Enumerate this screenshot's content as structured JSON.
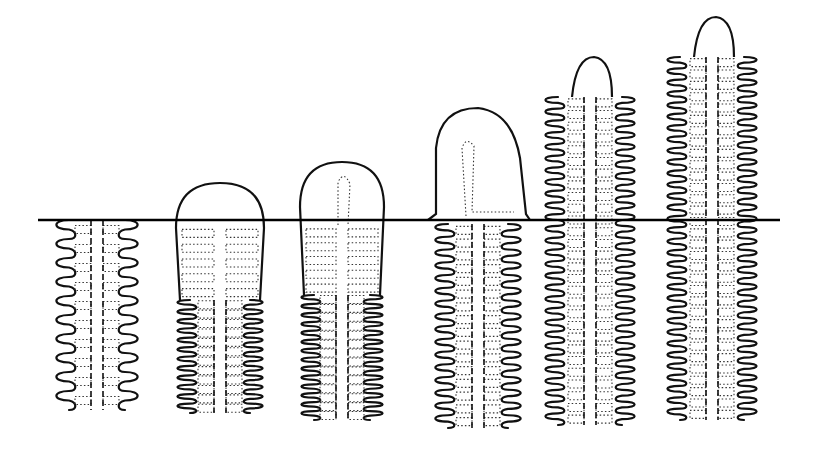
{
  "figure": {
    "surface_line": {
      "x1": 38,
      "x2": 780,
      "y": 220
    },
    "line_color": "#111111",
    "background": "#ffffff",
    "stages": [
      {
        "id": 1,
        "cx": 97,
        "top": 220,
        "bottom": 410,
        "halfWidth": 42,
        "tip": "none",
        "emerged": false,
        "rings": 14
      },
      {
        "id": 2,
        "cx": 220,
        "top": 183,
        "bottom": 413,
        "halfWidth": 44,
        "tip": "dome",
        "emerged": true,
        "rings": 16
      },
      {
        "id": 3,
        "cx": 342,
        "top": 162,
        "bottom": 420,
        "halfWidth": 42,
        "tip": "dome",
        "emerged": true,
        "rings": 18
      },
      {
        "id": 4,
        "cx": 478,
        "top": 108,
        "bottom": 428,
        "halfWidth": 44,
        "tip": "finger",
        "emerged": true,
        "rings": 20
      },
      {
        "id": 5,
        "cx": 590,
        "top": 57,
        "bottom": 425,
        "halfWidth": 46,
        "tip": "segmented",
        "emerged": true,
        "rings": 28
      },
      {
        "id": 6,
        "cx": 712,
        "top": 17,
        "bottom": 420,
        "halfWidth": 46,
        "tip": "segmented",
        "emerged": true,
        "rings": 32
      }
    ]
  }
}
